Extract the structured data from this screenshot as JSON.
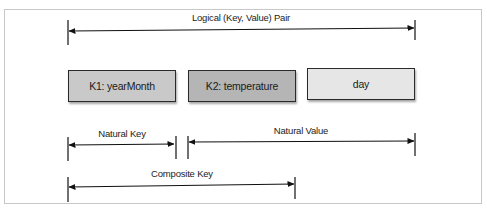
{
  "diagram": {
    "top_span": {
      "label": "Logical (Key, Value) Pair"
    },
    "boxes": [
      {
        "label": "K1: yearMonth",
        "fill": "#c9c9c9"
      },
      {
        "label": "K2: temperature",
        "fill": "#b5b5b5"
      },
      {
        "label": "day",
        "fill": "#e6e6e6"
      }
    ],
    "natural_key": {
      "label": "Natural Key"
    },
    "natural_value": {
      "label": "Natural Value"
    },
    "composite_key": {
      "label": "Composite Key"
    }
  }
}
